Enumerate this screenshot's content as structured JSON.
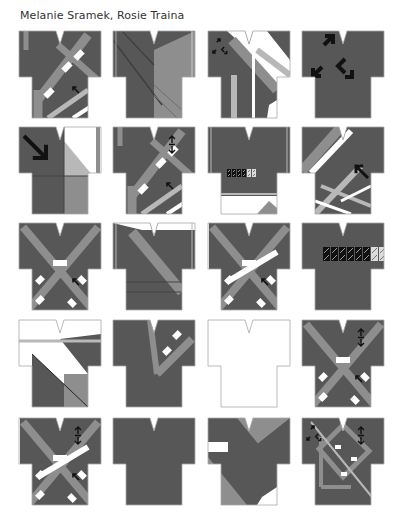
{
  "caption": "Melanie Sramek, Rosie Traina",
  "colors": {
    "dark": "#575757",
    "mid": "#8e8e8e",
    "light": "#b8b8b8",
    "white": "#ffffff",
    "outline": "#a8a8a8",
    "arrow": "#111111"
  },
  "grid": {
    "columns_x": [
      18,
      112,
      207,
      301
    ],
    "rows_y": [
      30,
      126,
      222,
      319,
      417
    ]
  },
  "garments": [
    {
      "id": 1,
      "row": 0,
      "col": 0,
      "base": "dark",
      "pattern": "diag-cross-bands",
      "arrows": [
        "nw-small"
      ]
    },
    {
      "id": 2,
      "row": 0,
      "col": 1,
      "base": "dark",
      "pattern": "right-panel-mid",
      "arrows": []
    },
    {
      "id": 3,
      "row": 0,
      "col": 2,
      "base": "dark",
      "pattern": "diag-white-bands",
      "arrows": [
        "expand-small"
      ]
    },
    {
      "id": 4,
      "row": 0,
      "col": 3,
      "base": "dark",
      "pattern": "solid",
      "arrows": [
        "expand-large"
      ]
    },
    {
      "id": 5,
      "row": 1,
      "col": 0,
      "base": "dark",
      "pattern": "white-quadrant",
      "arrows": [
        "se-large"
      ]
    },
    {
      "id": 6,
      "row": 1,
      "col": 1,
      "base": "dark",
      "pattern": "diag-cross-bands",
      "arrows": [
        "updown",
        "nw-small"
      ]
    },
    {
      "id": 7,
      "row": 1,
      "col": 2,
      "base": "dark",
      "pattern": "hem-white",
      "arrows": [
        "tiny-row"
      ]
    },
    {
      "id": 8,
      "row": 1,
      "col": 3,
      "base": "dark",
      "pattern": "diag-plaid",
      "arrows": [
        "nw-large"
      ]
    },
    {
      "id": 9,
      "row": 2,
      "col": 0,
      "base": "dark",
      "pattern": "x-bands",
      "arrows": [
        "nw-small"
      ]
    },
    {
      "id": 10,
      "row": 2,
      "col": 1,
      "base": "dark",
      "pattern": "single-diag",
      "arrows": []
    },
    {
      "id": 11,
      "row": 2,
      "col": 2,
      "base": "dark",
      "pattern": "x-bands-white",
      "arrows": [
        "nw-small"
      ]
    },
    {
      "id": 12,
      "row": 2,
      "col": 3,
      "base": "dark",
      "pattern": "solid",
      "arrows": [
        "tiny-row-large"
      ]
    },
    {
      "id": 13,
      "row": 3,
      "col": 0,
      "base": "white",
      "pattern": "triangle-dark",
      "arrows": []
    },
    {
      "id": 14,
      "row": 3,
      "col": 1,
      "base": "dark",
      "pattern": "v-band",
      "arrows": []
    },
    {
      "id": 15,
      "row": 3,
      "col": 2,
      "base": "white",
      "pattern": "outline-only",
      "arrows": []
    },
    {
      "id": 16,
      "row": 3,
      "col": 3,
      "base": "dark",
      "pattern": "x-bands",
      "arrows": [
        "updown",
        "nw-small"
      ]
    },
    {
      "id": 17,
      "row": 4,
      "col": 0,
      "base": "dark",
      "pattern": "x-bands-white",
      "arrows": [
        "updown",
        "nw-small"
      ]
    },
    {
      "id": 18,
      "row": 4,
      "col": 1,
      "base": "dark",
      "pattern": "solid",
      "arrows": []
    },
    {
      "id": 19,
      "row": 4,
      "col": 2,
      "base": "mid",
      "pattern": "big-diag",
      "arrows": []
    },
    {
      "id": 20,
      "row": 4,
      "col": 3,
      "base": "dark",
      "pattern": "square-frame",
      "arrows": [
        "expand-small",
        "updown"
      ]
    }
  ]
}
